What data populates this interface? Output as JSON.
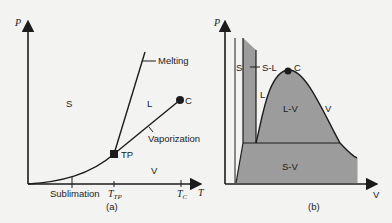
{
  "figure_a": {
    "y_axis_label": "P",
    "x_axis_label": "T",
    "regions": {
      "solid": "S",
      "liquid": "L",
      "vapor": "V"
    },
    "curves": {
      "melting": "Melting",
      "vaporization": "Vaporization",
      "sublimation": "Sublimation"
    },
    "points": {
      "triple_point": "TP",
      "critical_point": "C"
    },
    "ticks": {
      "t_tp_main": "T",
      "t_tp_sub": "TP",
      "t_c_main": "T",
      "t_c_sub": "C"
    },
    "caption": "(a)"
  },
  "figure_b": {
    "y_axis_label": "P",
    "x_axis_label": "V",
    "regions": {
      "solid": "S",
      "solid_liquid": "S-L",
      "liquid": "L",
      "liquid_vapor": "L-V",
      "vapor": "V",
      "solid_vapor": "S-V"
    },
    "points": {
      "critical_point": "C"
    },
    "caption": "(b)"
  },
  "colors": {
    "background": "#f3f3f1",
    "ink": "#1c1c1c",
    "two_phase_fill": "#9c9c9c"
  }
}
